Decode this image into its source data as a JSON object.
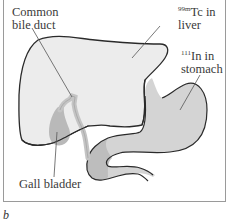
{
  "figure": {
    "panel_label": "b",
    "labels": {
      "common_bile_duct": [
        "Common",
        "bile duct"
      ],
      "liver": {
        "isotope_mass": "99m",
        "isotope_symbol": "Tc in",
        "line2": "liver"
      },
      "stomach": {
        "isotope_mass": "111",
        "isotope_symbol": "In in",
        "line2": "stomach"
      },
      "gall_bladder": "Gall bladder"
    },
    "colors": {
      "liver_fill": "#ececec",
      "stomach_fill": "#d2d2d2",
      "gallbladder_fill": "#b9b9b9",
      "outline": "#2a2a2a",
      "frame": "#9a9a9a",
      "text": "#3a3a3a"
    }
  }
}
